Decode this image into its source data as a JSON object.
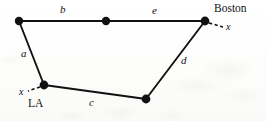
{
  "figure": {
    "type": "undirected-graph-diagram",
    "background_color": "#fdfdfc",
    "stroke_color": "#111111",
    "vertices": [
      {
        "id": "v-top-left",
        "name": "vertex-top-left",
        "x": 19,
        "y": 21,
        "radius": 4.2,
        "label": ""
      },
      {
        "id": "v-top-mid",
        "name": "vertex-top-middle",
        "x": 106,
        "y": 21,
        "radius": 4.2,
        "label": ""
      },
      {
        "id": "v-boston",
        "name": "vertex-boston",
        "x": 205,
        "y": 21,
        "radius": 4.4,
        "label": "Boston"
      },
      {
        "id": "v-bottom-right",
        "name": "vertex-bottom-right",
        "x": 146,
        "y": 99,
        "radius": 4.4,
        "label": ""
      },
      {
        "id": "v-la",
        "name": "vertex-la",
        "x": 44,
        "y": 85,
        "radius": 4.4,
        "label": "LA"
      }
    ],
    "edges": [
      {
        "id": "edge-a",
        "label": "a",
        "from": "v-top-left",
        "to": "v-la",
        "label_x": 21,
        "label_y": 48
      },
      {
        "id": "edge-b",
        "label": "b",
        "from": "v-top-left",
        "to": "v-top-mid",
        "label_x": 60,
        "label_y": 4
      },
      {
        "id": "edge-e",
        "label": "e",
        "from": "v-top-mid",
        "to": "v-boston",
        "label_x": 152,
        "label_y": 5
      },
      {
        "id": "edge-d",
        "label": "d",
        "from": "v-boston",
        "to": "v-bottom-right",
        "label_x": 181,
        "label_y": 55
      },
      {
        "id": "edge-c",
        "label": "c",
        "from": "v-la",
        "to": "v-bottom-right",
        "label_x": 89,
        "label_y": 97
      }
    ],
    "dashed_stubs": [
      {
        "id": "stub-boston",
        "name": "dashed-stub-boston",
        "label": "x",
        "from_x": 209,
        "from_y": 23,
        "to_x": 222,
        "to_y": 27,
        "label_x": 226,
        "label_y": 22
      },
      {
        "id": "stub-la",
        "name": "dashed-stub-la",
        "label": "x",
        "from_x": 40,
        "from_y": 87,
        "to_x": 29,
        "to_y": 91,
        "label_x": 19,
        "label_y": 87
      }
    ],
    "city_labels": [
      {
        "id": "label-boston",
        "name": "city-label-boston",
        "text": "Boston",
        "x": 214,
        "y": 3
      },
      {
        "id": "label-la",
        "name": "city-label-la",
        "text": "LA",
        "x": 28,
        "y": 98
      }
    ]
  }
}
